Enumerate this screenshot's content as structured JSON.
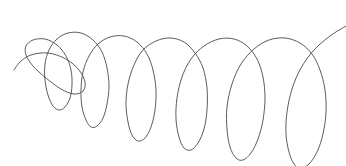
{
  "figure": {
    "background_color": "#ffffff",
    "width": 346,
    "height": 166,
    "title": "",
    "caption": ""
  },
  "chart_data": {
    "type": "line",
    "title": "",
    "subtitle": "",
    "xlabel": "",
    "ylabel": "",
    "legend": [],
    "legend_position": "none",
    "grid": false,
    "axes_visible": false,
    "tick_labels_x": [],
    "tick_labels_y": [],
    "xlim": [
      0,
      346
    ],
    "ylim": [
      0,
      166
    ],
    "series": [
      {
        "name": "spiral-curve",
        "color": "#4a4a4a",
        "stroke_width": 0.9,
        "loop_count": 12,
        "points": [
          [
            14,
            70
          ],
          [
            20,
            62
          ],
          [
            31,
            55
          ],
          [
            48,
            53
          ],
          [
            66,
            59
          ],
          [
            79,
            70
          ],
          [
            85,
            82
          ],
          [
            83,
            91
          ],
          [
            74,
            94
          ],
          [
            61,
            89
          ],
          [
            46,
            78
          ],
          [
            33,
            66
          ],
          [
            26,
            55
          ],
          [
            26,
            46
          ],
          [
            33,
            40
          ],
          [
            45,
            39
          ],
          [
            57,
            45
          ],
          [
            66,
            56
          ],
          [
            71,
            70
          ],
          [
            72,
            85
          ],
          [
            70,
            98
          ],
          [
            65,
            107
          ],
          [
            59,
            110
          ],
          [
            53,
            106
          ],
          [
            48,
            95
          ],
          [
            45,
            80
          ],
          [
            45,
            64
          ],
          [
            49,
            50
          ],
          [
            57,
            39
          ],
          [
            68,
            33
          ],
          [
            81,
            33
          ],
          [
            93,
            40
          ],
          [
            102,
            52
          ],
          [
            107,
            68
          ],
          [
            109,
            86
          ],
          [
            107,
            104
          ],
          [
            103,
            118
          ],
          [
            97,
            126
          ],
          [
            91,
            127
          ],
          [
            86,
            120
          ],
          [
            82,
            107
          ],
          [
            81,
            90
          ],
          [
            83,
            72
          ],
          [
            89,
            56
          ],
          [
            98,
            44
          ],
          [
            110,
            37
          ],
          [
            124,
            36
          ],
          [
            137,
            42
          ],
          [
            147,
            54
          ],
          [
            153,
            70
          ],
          [
            156,
            90
          ],
          [
            155,
            110
          ],
          [
            151,
            127
          ],
          [
            145,
            138
          ],
          [
            138,
            141
          ],
          [
            132,
            135
          ],
          [
            128,
            122
          ],
          [
            126,
            104
          ],
          [
            128,
            84
          ],
          [
            134,
            65
          ],
          [
            143,
            50
          ],
          [
            156,
            41
          ],
          [
            170,
            38
          ],
          [
            184,
            42
          ],
          [
            195,
            53
          ],
          [
            203,
            68
          ],
          [
            207,
            88
          ],
          [
            207,
            110
          ],
          [
            204,
            129
          ],
          [
            198,
            143
          ],
          [
            191,
            150
          ],
          [
            184,
            148
          ],
          [
            179,
            137
          ],
          [
            176,
            119
          ],
          [
            177,
            98
          ],
          [
            182,
            77
          ],
          [
            191,
            59
          ],
          [
            204,
            46
          ],
          [
            219,
            39
          ],
          [
            234,
            39
          ],
          [
            247,
            46
          ],
          [
            257,
            59
          ],
          [
            263,
            77
          ],
          [
            265,
            98
          ],
          [
            263,
            120
          ],
          [
            258,
            139
          ],
          [
            251,
            153
          ],
          [
            243,
            160
          ],
          [
            236,
            158
          ],
          [
            230,
            147
          ],
          [
            227,
            129
          ],
          [
            227,
            107
          ],
          [
            232,
            84
          ],
          [
            241,
            64
          ],
          [
            254,
            49
          ],
          [
            269,
            40
          ],
          [
            285,
            38
          ],
          [
            300,
            43
          ],
          [
            312,
            54
          ],
          [
            320,
            70
          ],
          [
            325,
            90
          ],
          [
            326,
            112
          ],
          [
            323,
            134
          ],
          [
            317,
            152
          ],
          [
            309,
            164
          ],
          [
            301,
            168
          ],
          [
            294,
            164
          ],
          [
            289,
            152
          ],
          [
            286,
            134
          ],
          [
            287,
            112
          ],
          [
            292,
            89
          ],
          [
            301,
            68
          ],
          [
            314,
            50
          ],
          [
            330,
            36
          ],
          [
            346,
            26
          ]
        ]
      }
    ]
  },
  "icons": {
    "curve": "spiral-curve-icon"
  }
}
